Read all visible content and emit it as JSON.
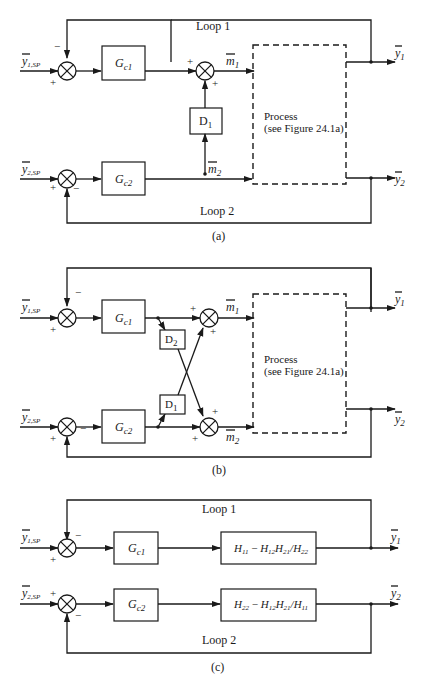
{
  "panels": {
    "a": {
      "caption": "(a)",
      "loop1_label": "Loop 1",
      "loop2_label": "Loop 2",
      "input1": {
        "symbol": "y",
        "sub": "1,SP"
      },
      "input2": {
        "symbol": "y",
        "sub": "2,SP"
      },
      "controller1": {
        "symbol": "G",
        "sub": "c1"
      },
      "controller2": {
        "symbol": "G",
        "sub": "c2"
      },
      "decoupler": {
        "symbol": "D",
        "sub": "1"
      },
      "m1": {
        "symbol": "m",
        "sub": "1"
      },
      "m2": {
        "symbol": "m",
        "sub": "2"
      },
      "process_line1": "Process",
      "process_line2": "(see Figure 24.1a)",
      "output1": {
        "symbol": "y",
        "sub": "1"
      },
      "output2": {
        "symbol": "y",
        "sub": "2"
      },
      "signs": {
        "plus": "+",
        "minus": "−"
      }
    },
    "b": {
      "caption": "(b)",
      "input1": {
        "symbol": "y",
        "sub": "1,SP"
      },
      "input2": {
        "symbol": "y",
        "sub": "2,SP"
      },
      "controller1": {
        "symbol": "G",
        "sub": "c1"
      },
      "controller2": {
        "symbol": "G",
        "sub": "c2"
      },
      "decoupler1": {
        "symbol": "D",
        "sub": "1"
      },
      "decoupler2": {
        "symbol": "D",
        "sub": "2"
      },
      "m1": {
        "symbol": "m",
        "sub": "1"
      },
      "m2": {
        "symbol": "m",
        "sub": "2"
      },
      "process_line1": "Process",
      "process_line2": "(see Figure 24.1a)",
      "output1": {
        "symbol": "y",
        "sub": "1"
      },
      "output2": {
        "symbol": "y",
        "sub": "2"
      },
      "signs": {
        "plus": "+",
        "minus": "−"
      }
    },
    "c": {
      "caption": "(c)",
      "loop1_label": "Loop 1",
      "loop2_label": "Loop 2",
      "input1": {
        "symbol": "y",
        "sub": "1,SP"
      },
      "input2": {
        "symbol": "y",
        "sub": "2,SP"
      },
      "controller1": {
        "symbol": "G",
        "sub": "c1"
      },
      "controller2": {
        "symbol": "G",
        "sub": "c2"
      },
      "plant1": {
        "a": "H",
        "a_sub": "11",
        "op": " − ",
        "b": "H",
        "b_sub": "12",
        "c": "H",
        "c_sub": "21",
        "div": "/",
        "d": "H",
        "d_sub": "22"
      },
      "plant2": {
        "a": "H",
        "a_sub": "22",
        "op": " − ",
        "b": "H",
        "b_sub": "12",
        "c": "H",
        "c_sub": "21",
        "div": "/",
        "d": "H",
        "d_sub": "11"
      },
      "output1": {
        "symbol": "y",
        "sub": "1"
      },
      "output2": {
        "symbol": "y",
        "sub": "2"
      },
      "signs": {
        "plus": "+",
        "minus": "−"
      }
    }
  }
}
